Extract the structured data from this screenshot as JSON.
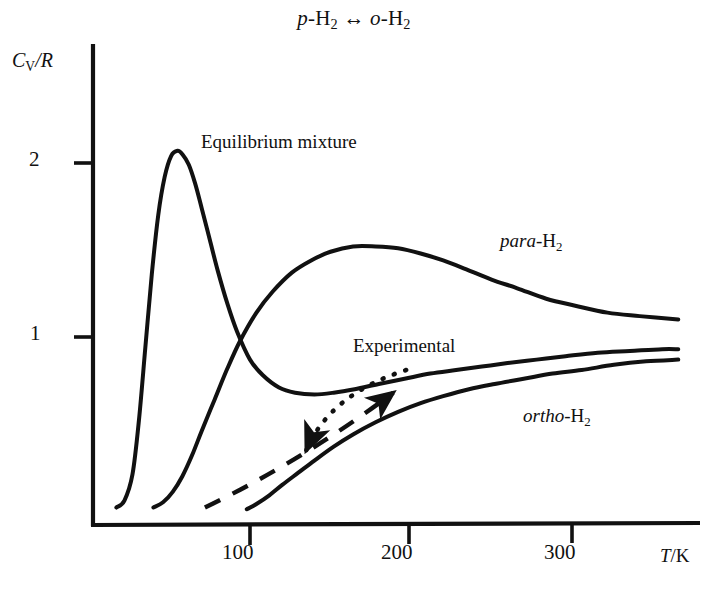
{
  "chart_data": {
    "type": "line",
    "title_parts": {
      "p_italic": "p",
      "first_species": "-H",
      "first_sub": "2",
      "arrow": "↔",
      "o_italic": "o",
      "second_species": "-H",
      "second_sub": "2"
    },
    "xlabel": "T/K",
    "xlabel_parts": {
      "symbol": "T",
      "unit": "/K"
    },
    "ylabel": "Cv/R",
    "ylabel_parts": {
      "symbol": "C",
      "subscript": "V",
      "divider": "/R"
    },
    "xlim": [
      0,
      366
    ],
    "ylim": [
      0,
      2.45
    ],
    "xticks": [
      100,
      200,
      300
    ],
    "xticklabels": [
      "100",
      "200",
      "300"
    ],
    "yticks": [
      1,
      2
    ],
    "yticklabels": [
      "1",
      "2"
    ],
    "grid": false,
    "legend": "inline-labels",
    "annotations": [
      {
        "text": "Equilibrium mixture",
        "x": 72,
        "y": 2.14,
        "style": "upright"
      },
      {
        "text": "para-H2",
        "x": 255,
        "y": 1.56,
        "style": "italic-prefix",
        "prefix": "para",
        "suffix": "-H",
        "sub": "2"
      },
      {
        "text": "ortho-H2",
        "x": 270,
        "y": 0.58,
        "style": "italic-prefix",
        "prefix": "ortho",
        "suffix": "-H",
        "sub": "2"
      },
      {
        "text": "Experimental",
        "x": 164,
        "y": 1.02,
        "style": "upright"
      }
    ],
    "arrows": [
      {
        "name": "experimental-dotted-arrow",
        "linestyle": "dotted",
        "from": [
          197,
          0.81
        ],
        "to": [
          135,
          0.35
        ],
        "head": "at-end"
      },
      {
        "name": "experimental-dashed-arrow",
        "linestyle": "dashed",
        "from": [
          72,
          0.02
        ],
        "to": [
          189,
          0.68
        ],
        "head": "at-end"
      }
    ],
    "series": [
      {
        "name": "Equilibrium mixture",
        "linestyle": "solid",
        "color": "#111111",
        "x": [
          17,
          22,
          27,
          31,
          35,
          39,
          43,
          47,
          51,
          55,
          58,
          62,
          66,
          70,
          75,
          80,
          86,
          92,
          100,
          108,
          118,
          128,
          140,
          152,
          165,
          180,
          196,
          212,
          228,
          244,
          260,
          278,
          296,
          316,
          336,
          356,
          366
        ],
        "y": [
          0.02,
          0.06,
          0.21,
          0.52,
          0.94,
          1.36,
          1.7,
          1.92,
          2.04,
          2.07,
          2.05,
          1.99,
          1.88,
          1.74,
          1.56,
          1.38,
          1.19,
          1.03,
          0.87,
          0.78,
          0.71,
          0.68,
          0.67,
          0.68,
          0.7,
          0.73,
          0.76,
          0.79,
          0.81,
          0.83,
          0.85,
          0.87,
          0.89,
          0.91,
          0.92,
          0.93,
          0.93
        ]
      },
      {
        "name": "para-H2",
        "linestyle": "solid",
        "color": "#111111",
        "x": [
          40,
          46,
          52,
          58,
          64,
          70,
          78,
          86,
          94,
          104,
          114,
          126,
          138,
          150,
          164,
          178,
          192,
          206,
          220,
          234,
          250,
          266,
          284,
          302,
          322,
          342,
          366
        ],
        "y": [
          0.02,
          0.05,
          0.11,
          0.2,
          0.32,
          0.46,
          0.64,
          0.82,
          0.98,
          1.14,
          1.26,
          1.37,
          1.44,
          1.49,
          1.52,
          1.52,
          1.51,
          1.48,
          1.44,
          1.39,
          1.33,
          1.28,
          1.22,
          1.18,
          1.14,
          1.12,
          1.1
        ]
      },
      {
        "name": "ortho-H2",
        "linestyle": "solid",
        "color": "#111111",
        "x": [
          98,
          104,
          112,
          120,
          130,
          140,
          152,
          164,
          178,
          192,
          206,
          220,
          236,
          252,
          270,
          288,
          306,
          326,
          346,
          366
        ],
        "y": [
          0.01,
          0.04,
          0.09,
          0.15,
          0.22,
          0.29,
          0.37,
          0.44,
          0.51,
          0.57,
          0.62,
          0.66,
          0.7,
          0.73,
          0.76,
          0.79,
          0.81,
          0.84,
          0.86,
          0.87
        ]
      }
    ]
  }
}
